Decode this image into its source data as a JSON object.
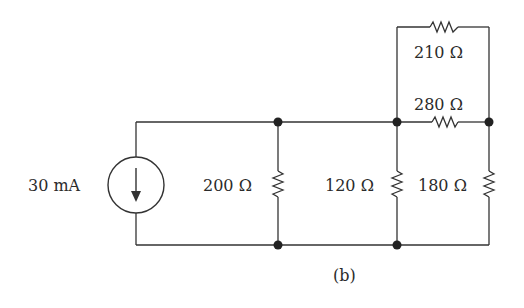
{
  "figure_label": "(b)",
  "source": {
    "type": "current-source",
    "value": "30 mA",
    "direction": "down"
  },
  "resistors": [
    {
      "id": "R1",
      "label": "200 Ω",
      "orientation": "vertical"
    },
    {
      "id": "R2",
      "label": "120 Ω",
      "orientation": "vertical"
    },
    {
      "id": "R3",
      "label": "180 Ω",
      "orientation": "vertical"
    },
    {
      "id": "R4",
      "label": "280 Ω",
      "orientation": "horizontal"
    },
    {
      "id": "R5",
      "label": "210 Ω",
      "orientation": "horizontal"
    }
  ]
}
